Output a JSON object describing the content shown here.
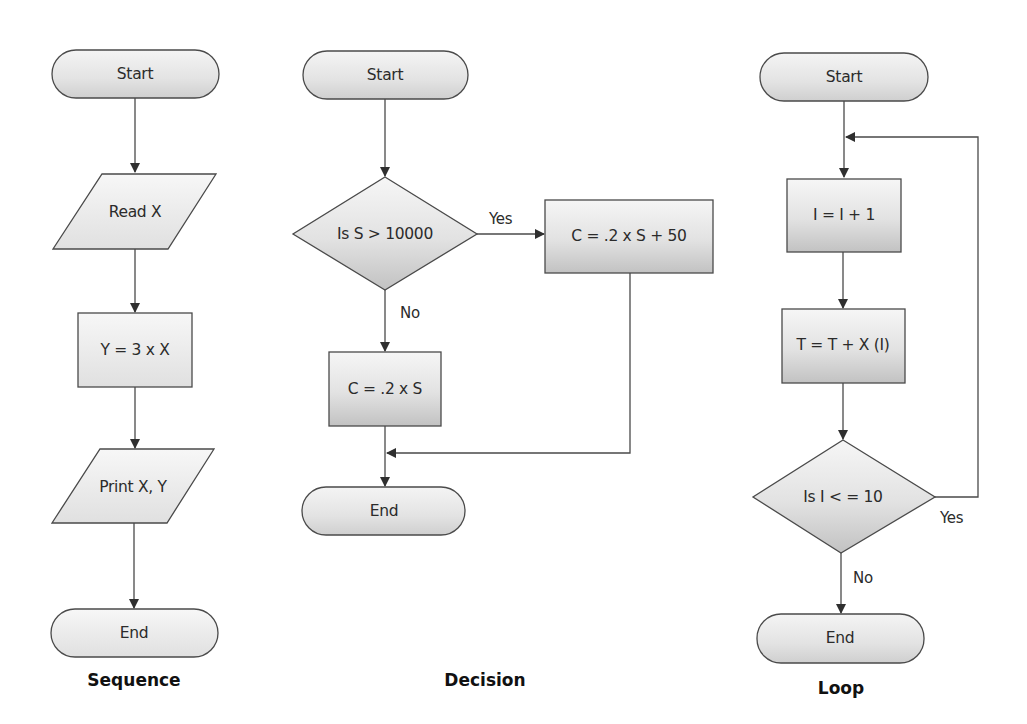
{
  "colors": {
    "stroke": "#4a4a4a",
    "fill_top": "#f5f5f5",
    "fill_bottom": "#c4c4c4",
    "light_fill_top": "#f6f6f6",
    "light_fill_bottom": "#e2e2e2",
    "text": "#2b2b2b"
  },
  "sequence": {
    "caption": "Sequence",
    "nodes": [
      {
        "type": "terminator",
        "label": "Start"
      },
      {
        "type": "input-output",
        "label": "Read X"
      },
      {
        "type": "process",
        "label": "Y = 3 x X"
      },
      {
        "type": "input-output",
        "label": "Print X, Y"
      },
      {
        "type": "terminator",
        "label": "End"
      }
    ]
  },
  "decision": {
    "caption": "Decision",
    "nodes": [
      {
        "type": "terminator",
        "label": "Start"
      },
      {
        "type": "decision",
        "label": "Is S > 10000"
      },
      {
        "type": "process",
        "label": "C = .2 x S + 50"
      },
      {
        "type": "process",
        "label": "C = .2 x S"
      },
      {
        "type": "terminator",
        "label": "End"
      }
    ],
    "edge_labels": {
      "yes": "Yes",
      "no": "No"
    }
  },
  "loop": {
    "caption": "Loop",
    "nodes": [
      {
        "type": "terminator",
        "label": "Start"
      },
      {
        "type": "process",
        "label": "I = I + 1"
      },
      {
        "type": "process",
        "label": "T = T +  X (I)"
      },
      {
        "type": "decision",
        "label": "Is I < = 10"
      },
      {
        "type": "terminator",
        "label": "End"
      }
    ],
    "edge_labels": {
      "yes": "Yes",
      "no": "No"
    }
  }
}
